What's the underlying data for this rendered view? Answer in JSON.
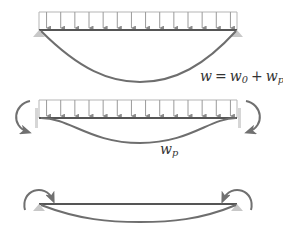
{
  "colors": {
    "beam": "#555555",
    "curve": "#6e6e6e",
    "load": "#9a9a9a",
    "support": "#c8c8c8",
    "wall": "#d6d6d6",
    "text": "#333333"
  },
  "diagrams": [
    {
      "id": "total-deflection",
      "description": "Simply supported beam under uniform load with total deflection",
      "label": {
        "var": "w",
        "eq": "=",
        "term1": "w",
        "term1_sub": "0",
        "plus": "+",
        "term2": "w",
        "term2_sub": "p"
      }
    },
    {
      "id": "particular-deflection",
      "description": "Clamped beam under uniform load with fixed-end moments",
      "label": {
        "var": "w",
        "sub": "p"
      }
    },
    {
      "id": "end-moment-correction",
      "description": "Simply supported beam loaded by end moments"
    }
  ],
  "load_arrow_count": 14
}
